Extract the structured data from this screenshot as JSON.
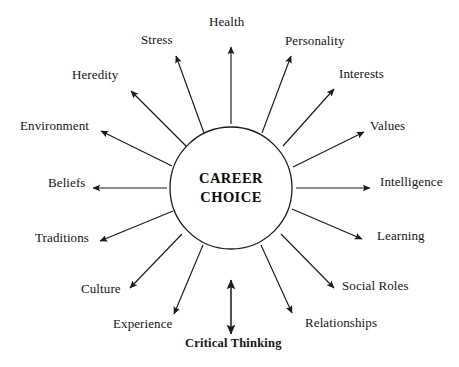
{
  "diagram": {
    "type": "radial-concept-map",
    "center": {
      "line1": "CAREER",
      "line2": "CHOICE",
      "shape": "circle",
      "cx": 231,
      "cy": 188,
      "r": 61,
      "stroke_color": "#1a1a1a"
    },
    "line_color": "#1a1a1a",
    "text_color": "#141414",
    "background_color": "#ffffff",
    "spokes": [
      {
        "label": "Health",
        "angle_deg": 270,
        "arrow": "single",
        "bold": false,
        "label_x": 209,
        "label_y": 15,
        "x1": 231,
        "y1": 124,
        "x2": 231,
        "y2": 47
      },
      {
        "label": "Personality",
        "angle_deg": 303,
        "arrow": "single",
        "bold": false,
        "label_x": 285,
        "label_y": 34,
        "x1": 262,
        "y1": 133,
        "x2": 291,
        "y2": 56
      },
      {
        "label": "Interests",
        "angle_deg": 326,
        "arrow": "single",
        "bold": false,
        "label_x": 339,
        "label_y": 67,
        "x1": 283,
        "y1": 146,
        "x2": 334,
        "y2": 89
      },
      {
        "label": "Values",
        "angle_deg": 345,
        "arrow": "single",
        "bold": false,
        "label_x": 370,
        "label_y": 119,
        "x1": 293,
        "y1": 167,
        "x2": 364,
        "y2": 132
      },
      {
        "label": "Intelligence",
        "angle_deg": 0,
        "arrow": "single",
        "bold": false,
        "label_x": 380,
        "label_y": 175,
        "x1": 296,
        "y1": 188,
        "x2": 370,
        "y2": 188
      },
      {
        "label": "Learning",
        "angle_deg": 18,
        "arrow": "single",
        "bold": false,
        "label_x": 377,
        "label_y": 229,
        "x1": 292,
        "y1": 209,
        "x2": 362,
        "y2": 239
      },
      {
        "label": "Social Roles",
        "angle_deg": 38,
        "arrow": "single",
        "bold": false,
        "label_x": 342,
        "label_y": 279,
        "x1": 281,
        "y1": 234,
        "x2": 334,
        "y2": 288
      },
      {
        "label": "Relationships",
        "angle_deg": 60,
        "arrow": "single",
        "bold": false,
        "label_x": 305,
        "label_y": 316,
        "x1": 261,
        "y1": 245,
        "x2": 292,
        "y2": 313
      },
      {
        "label": "Critical Thinking",
        "angle_deg": 90,
        "arrow": "double",
        "bold": true,
        "label_x": 185,
        "label_y": 337,
        "x1": 231,
        "y1": 280,
        "x2": 231,
        "y2": 334
      },
      {
        "label": "Experience",
        "angle_deg": 118,
        "arrow": "single",
        "bold": false,
        "label_x": 113,
        "label_y": 317,
        "x1": 203,
        "y1": 245,
        "x2": 174,
        "y2": 314
      },
      {
        "label": "Culture",
        "angle_deg": 140,
        "arrow": "single",
        "bold": false,
        "label_x": 81,
        "label_y": 282,
        "x1": 182,
        "y1": 234,
        "x2": 130,
        "y2": 288
      },
      {
        "label": "Traditions",
        "angle_deg": 160,
        "arrow": "single",
        "bold": false,
        "label_x": 35,
        "label_y": 231,
        "x1": 173,
        "y1": 211,
        "x2": 100,
        "y2": 241
      },
      {
        "label": "Beliefs",
        "angle_deg": 180,
        "arrow": "single",
        "bold": false,
        "label_x": 48,
        "label_y": 176,
        "x1": 167,
        "y1": 188,
        "x2": 93,
        "y2": 188
      },
      {
        "label": "Environment",
        "angle_deg": 200,
        "arrow": "single",
        "bold": false,
        "label_x": 20,
        "label_y": 119,
        "x1": 172,
        "y1": 166,
        "x2": 101,
        "y2": 131
      },
      {
        "label": "Heredity",
        "angle_deg": 222,
        "arrow": "single",
        "bold": false,
        "label_x": 72,
        "label_y": 68,
        "x1": 187,
        "y1": 147,
        "x2": 131,
        "y2": 91
      },
      {
        "label": "Stress",
        "angle_deg": 250,
        "arrow": "single",
        "bold": false,
        "label_x": 141,
        "label_y": 33,
        "x1": 204,
        "y1": 133,
        "x2": 176,
        "y2": 56
      }
    ]
  }
}
